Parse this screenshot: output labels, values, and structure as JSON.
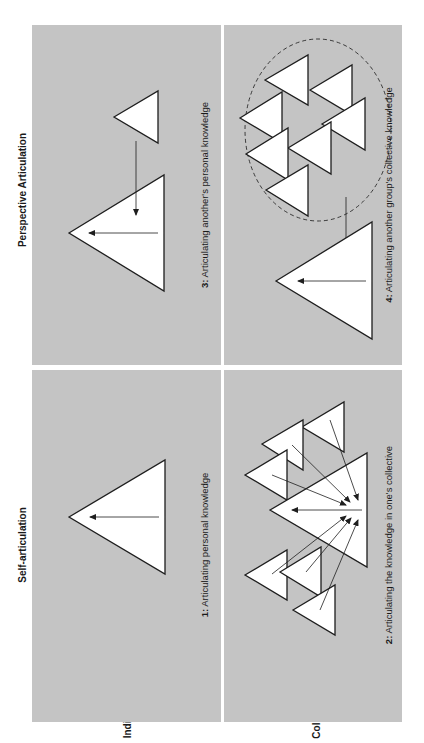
{
  "diagram": {
    "orientation": "rotated 90 degrees counter-clockwise",
    "column_headers": {
      "self": "Self-articulation",
      "perspective": "Perspective Articulation"
    },
    "row_headers": {
      "individual": "Individual",
      "collective": "Collective"
    },
    "quadrants": [
      {
        "id": 1,
        "number": "1:",
        "caption": " Articulating personal knowledge",
        "row": "Individual",
        "column": "Self-articulation"
      },
      {
        "id": 2,
        "number": "2:",
        "caption": " Articulating the knowledge in one's collective",
        "row": "Collective",
        "column": "Self-articulation"
      },
      {
        "id": 3,
        "number": "3:",
        "caption": " Articulating another's personal knowledge",
        "row": "Individual",
        "column": "Perspective Articulation"
      },
      {
        "id": 4,
        "number": "4:",
        "caption": " Articulating another group's collective knowledge",
        "row": "Collective",
        "column": "Perspective Articulation"
      }
    ],
    "colors": {
      "panel": "#c4c4c4",
      "background": "#ffffff",
      "stroke": "#1e1e1e"
    }
  }
}
